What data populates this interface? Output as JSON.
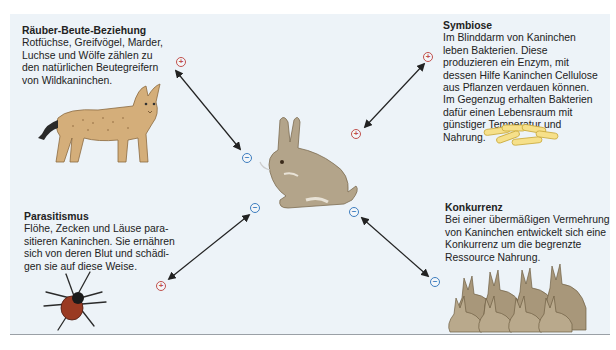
{
  "diagram": {
    "center": {
      "organism": "Wildkaninchen",
      "icon": "rabbit-illustration"
    },
    "relations": [
      {
        "id": "raeuber-beute",
        "title": "Räuber-Beute-Beziehung",
        "text": "Rotfüchse, Greifvögel, Marder, Luchse und Wölfe zählen zu den natürlichen Beutegreifern von Wildkaninchen.",
        "partner_icon": "lynx-illustration",
        "partner_sign": "+",
        "rabbit_sign": "−"
      },
      {
        "id": "symbiose",
        "title": "Symbiose",
        "text": "Im Blinddarm von Kaninchen leben Bakterien. Diese produzieren ein Enzym, mit dessen Hilfe Kaninchen Cellulose aus Pflanzen verdauen können. Im Gegenzug erhalten Bakterien dafür einen Lebensraum mit günstiger Temperatur und Nahrung.",
        "partner_icon": "bacteria-illustration",
        "partner_sign": "+",
        "rabbit_sign": "+"
      },
      {
        "id": "parasitismus",
        "title": "Parasitismus",
        "text": "Flöhe, Zecken und Läuse parasitieren Kaninchen. Sie ernähren sich von deren Blut und schädigen sie auf diese Weise.",
        "text_lines": [
          "Flöhe, Zecken und Läuse para-",
          "sitieren Kaninchen. Sie ernähren",
          "sich von deren Blut und schädi-",
          "gen sie auf diese Weise."
        ],
        "partner_icon": "tick-illustration",
        "partner_sign": "+",
        "rabbit_sign": "−"
      },
      {
        "id": "konkurrenz",
        "title": "Konkurrenz",
        "text": "Bei einer übermäßigen Vermehrung von Kaninchen entwickelt sich eine Konkurrenz um die begrenzte Ressource Nahrung.",
        "partner_icon": "rabbit-group-illustration",
        "partner_sign": "−",
        "rabbit_sign": "−"
      }
    ]
  },
  "colors": {
    "panel_bg": "#edf3f8",
    "plus": "#c0504d",
    "minus": "#3d7dbf",
    "arrow": "#222222"
  }
}
